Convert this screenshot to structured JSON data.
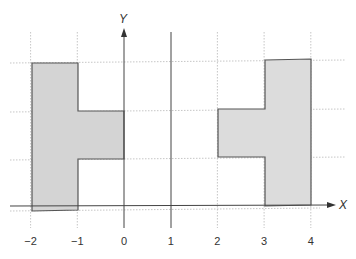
{
  "diagram": {
    "axes": {
      "x_label": "X",
      "y_label": "Y",
      "x_ticks": [
        {
          "value": -2,
          "label": "−2"
        },
        {
          "value": -1,
          "label": "−1"
        },
        {
          "value": 0,
          "label": "0"
        },
        {
          "value": 1,
          "label": "1"
        },
        {
          "value": 2,
          "label": "2"
        },
        {
          "value": 3,
          "label": "3"
        },
        {
          "value": 4,
          "label": "4"
        }
      ]
    },
    "vertical_line_at_x": 1,
    "shapes": [
      {
        "name": "left-shape",
        "description": "Shaded T-shaped region: tall bar from x=-2 to -1 with a stub extending to x=0 in the middle band",
        "fill": "#d4d4d4",
        "stroke": "#555555"
      },
      {
        "name": "right-shape",
        "description": "Mirror of the left shape reflected across x=1: tall bar from x=3 to 4 with a stub extending to x=2 in the middle band",
        "fill": "#dcdcdc",
        "stroke": "#555555"
      }
    ],
    "colors": {
      "axis": "#444444",
      "dotted_guide": "#b8b8b8",
      "shape_fill": "#d4d4d4"
    }
  }
}
